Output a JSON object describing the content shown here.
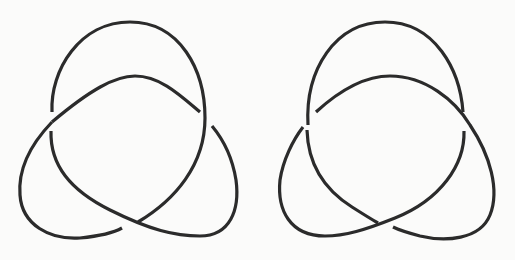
{
  "figure": {
    "stroke_color": "#2b2b2b",
    "background_color": "#fbfbfa",
    "stroke_width": 3.2,
    "knots": [
      {
        "name": "left-handed-trefoil",
        "handedness": "left",
        "crossings": 3
      },
      {
        "name": "right-handed-trefoil",
        "handedness": "right",
        "crossings": 3
      }
    ]
  }
}
